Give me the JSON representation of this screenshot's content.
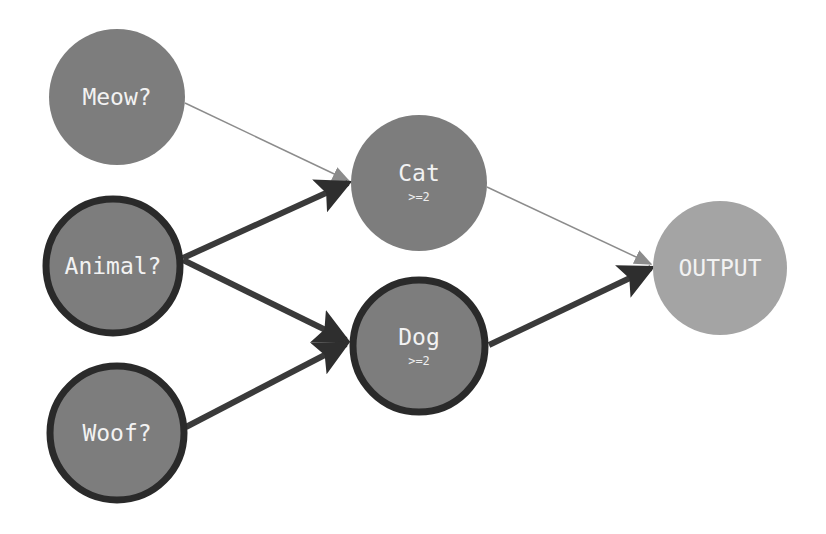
{
  "diagram": {
    "title": "",
    "colors": {
      "node_fill": "#7d7d7d",
      "output_fill": "#a4a4a4",
      "strong_edge": "#3a3a3a",
      "weak_edge": "#8c8c8c",
      "active_border": "#2a2a2a",
      "label": "#f2f2f2",
      "background": "#ffffff"
    },
    "nodes": [
      {
        "id": "meow",
        "label": "Meow?",
        "sub": "",
        "cx": 117,
        "cy": 97,
        "r": 68,
        "active": false,
        "fill": "#7d7d7d"
      },
      {
        "id": "animal",
        "label": "Animal?",
        "sub": "",
        "cx": 113,
        "cy": 266,
        "r": 68,
        "active": true,
        "fill": "#7d7d7d"
      },
      {
        "id": "woof",
        "label": "Woof?",
        "sub": "",
        "cx": 117,
        "cy": 433,
        "r": 68,
        "active": true,
        "fill": "#7d7d7d"
      },
      {
        "id": "cat",
        "label": "Cat",
        "sub": ">=2",
        "cx": 419,
        "cy": 183,
        "r": 68,
        "active": false,
        "fill": "#7d7d7d"
      },
      {
        "id": "dog",
        "label": "Dog",
        "sub": ">=2",
        "cx": 419,
        "cy": 345,
        "r": 68,
        "active": true,
        "fill": "#7d7d7d"
      },
      {
        "id": "output",
        "label": "OUTPUT",
        "sub": "",
        "cx": 720,
        "cy": 268,
        "r": 67,
        "active": false,
        "fill": "#a4a4a4"
      }
    ],
    "edges": [
      {
        "from": "meow",
        "to": "cat",
        "strength": "weak"
      },
      {
        "from": "animal",
        "to": "cat",
        "strength": "strong"
      },
      {
        "from": "animal",
        "to": "dog",
        "strength": "strong"
      },
      {
        "from": "woof",
        "to": "dog",
        "strength": "strong"
      },
      {
        "from": "cat",
        "to": "output",
        "strength": "weak"
      },
      {
        "from": "dog",
        "to": "output",
        "strength": "strong"
      }
    ]
  }
}
